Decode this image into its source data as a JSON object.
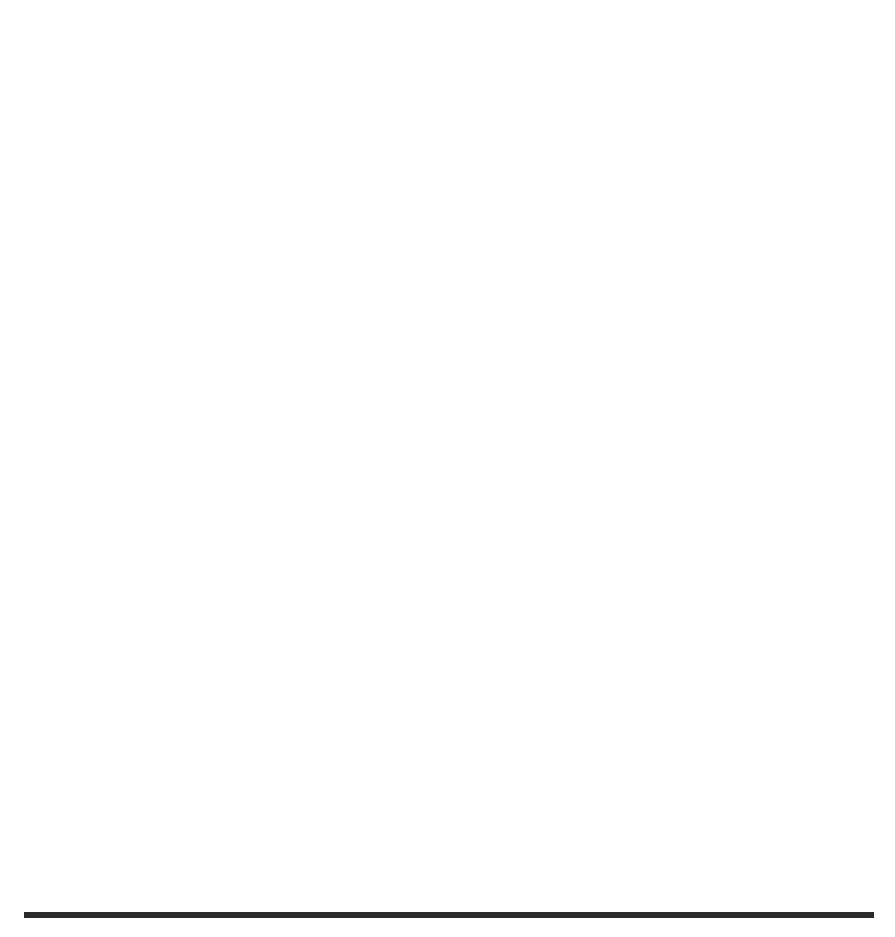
{
  "figure": {
    "panel_label": "(b)",
    "background": "#ffffff",
    "ink_color": "#1a1a1a"
  },
  "colors": {
    "cmps": "#595959",
    "cps": "#4d4d4d",
    "fmps": "#111111",
    "axis": "#3a3a3a",
    "rule": "#2b2b2b"
  },
  "top_chart": {
    "ylabel": "Objective: Throughput",
    "xlabel": "Number of Rounds",
    "ytick_labels": [
      "195",
      "200",
      "205",
      "210",
      "215",
      "220",
      "225",
      "230"
    ],
    "xtick_labels": [
      "100",
      "200",
      "300",
      "400",
      "500"
    ],
    "legend": [
      {
        "label": "CMPS",
        "marker": "square"
      },
      {
        "label": "CPS",
        "marker": "triangle"
      },
      {
        "label": "FMPS",
        "marker": "circle"
      }
    ]
  },
  "bottom_chart": {
    "ylabel": "Fitness: Evaluations",
    "xlabel": "Number of Rounds",
    "ytick_labels": [
      "0",
      "2",
      "4",
      "6",
      "8",
      "10",
      "12"
    ],
    "xtick_labels": [
      "0",
      "100",
      "200",
      "300",
      "400",
      "500"
    ],
    "legend": [
      {
        "label": "CMPS",
        "marker": "circle"
      },
      {
        "label": "CPS",
        "marker": "triangle"
      },
      {
        "label": "FMPS",
        "marker": "square"
      }
    ]
  },
  "chart_data": [
    {
      "type": "line",
      "id": "objective-throughput",
      "title": "(b)",
      "xlabel": "Number of Rounds",
      "ylabel": "Objective: Throughput",
      "x": [
        50,
        100,
        150,
        200,
        250,
        300,
        350,
        400,
        450,
        500
      ],
      "xlim": [
        40,
        515
      ],
      "ylim": [
        195,
        230
      ],
      "xticks": [
        100,
        200,
        300,
        400,
        500
      ],
      "yticks": [
        195,
        200,
        205,
        210,
        215,
        220,
        225,
        230
      ],
      "grid": false,
      "legend_position": "top-right",
      "series": [
        {
          "name": "CMPS",
          "marker": "square",
          "linestyle": "solid",
          "color": "#595959",
          "values": [
            228.0,
            225.1,
            223.0,
            220.3,
            215.4,
            212.5,
            208.4,
            205.4,
            203.4,
            202.5
          ]
        },
        {
          "name": "CPS",
          "marker": "triangle",
          "linestyle": "dashed",
          "color": "#4d4d4d",
          "values": [
            221.2,
            219.2,
            215.3,
            212.2,
            208.3,
            205.4,
            202.3,
            201.5,
            199.5,
            198.5
          ]
        },
        {
          "name": "FMPS",
          "marker": "circle",
          "linestyle": "dotted",
          "color": "#111111",
          "values": [
            217.0,
            217.1,
            217.2,
            216.2,
            215.4,
            213.4,
            211.3,
            208.3,
            205.4,
            200.4
          ]
        }
      ]
    },
    {
      "type": "line",
      "id": "fitness-evaluations",
      "xlabel": "Number of Rounds",
      "ylabel": "Fitness: Evaluations",
      "x": [
        0,
        50,
        100,
        150,
        200,
        250,
        300,
        350,
        400,
        450,
        500
      ],
      "xlim": [
        -18,
        518
      ],
      "ylim": [
        -0.45,
        13.2
      ],
      "xticks": [
        0,
        100,
        200,
        300,
        400,
        500
      ],
      "yticks": [
        0,
        2,
        4,
        6,
        8,
        10,
        12
      ],
      "grid": false,
      "legend_position": "top-left",
      "series": [
        {
          "name": "FMPS",
          "marker": "square",
          "linestyle": "solid",
          "color": "#111111",
          "values": [
            0.0,
            1.4,
            2.5,
            3.85,
            5.1,
            6.2,
            7.3,
            8.6,
            9.85,
            11.15,
            12.65
          ]
        }
      ]
    }
  ]
}
